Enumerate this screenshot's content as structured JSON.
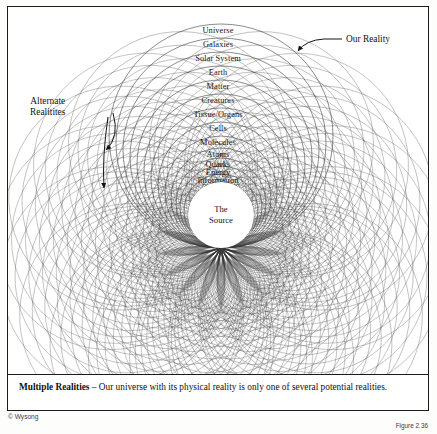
{
  "figure": {
    "center_label_line1": "The",
    "center_label_line2": "Source",
    "rings": [
      "Universe",
      "Galaxies",
      "Solar System",
      "Earth",
      "Matter",
      "Creatures",
      "Tissue/Organs",
      "Cells",
      "Molecules",
      "Atoms",
      "Quarks",
      "Energy",
      "Information",
      "Mind"
    ],
    "annotations": {
      "our_reality": "Our Reality",
      "alternate_line1": "Alternate",
      "alternate_line2": "Realitites"
    },
    "geometry": {
      "pivot_x": 220,
      "pivot_y": 247,
      "ring_radii": [
        112,
        105,
        98,
        91,
        84,
        77,
        70,
        63,
        56,
        50,
        45,
        41,
        37,
        33
      ],
      "rotation_count": 17,
      "rotation_span_deg": 360,
      "stroke_color": "#3a3a3a"
    }
  },
  "caption": {
    "lead": "Multiple Realities",
    "dash": " – ",
    "body": "Our universe with its physical reality is only one of several potential realities."
  },
  "footer": {
    "credit": "© Wysong",
    "figure_number": "Figure 2.36"
  }
}
